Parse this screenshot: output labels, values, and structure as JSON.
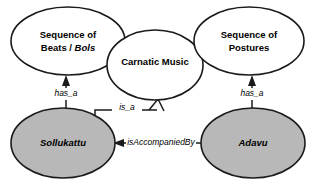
{
  "diagram": {
    "type": "entity-relationship-graph",
    "background_color": "#ffffff",
    "stroke_color": "#1a1a1a",
    "shaded_fill": "#b8b8b8",
    "plain_fill": "#ffffff",
    "nodes": [
      {
        "id": "beats",
        "label_line1": "Sequence of",
        "label_line2_plain": "Beats / ",
        "label_line2_italic": "Bols",
        "style": "white",
        "cx": 68,
        "cy": 41,
        "rx": 57,
        "ry": 34
      },
      {
        "id": "carnatic",
        "label_line1": "Carnatic Music",
        "style": "white",
        "cx": 155,
        "cy": 65,
        "rx": 48,
        "ry": 35
      },
      {
        "id": "postures",
        "label_line1": "Sequence of",
        "label_line2_plain": "Postures",
        "style": "white",
        "cx": 249,
        "cy": 41,
        "rx": 55,
        "ry": 34
      },
      {
        "id": "sollukattu",
        "label_line1": "Sollukattu",
        "style": "gray-italic",
        "cx": 63,
        "cy": 143,
        "rx": 52,
        "ry": 35
      },
      {
        "id": "adavu",
        "label_line1": "Adavu",
        "style": "gray-italic",
        "cx": 253,
        "cy": 143,
        "rx": 52,
        "ry": 35
      }
    ],
    "edges": [
      {
        "id": "sollukattu-has_a-beats",
        "label": "has_a",
        "from": "sollukattu",
        "to": "beats",
        "arrowhead": "filled-triangle",
        "label_x": 66,
        "label_y": 94
      },
      {
        "id": "adavu-has_a-postures",
        "label": "has_a",
        "from": "adavu",
        "to": "postures",
        "arrowhead": "filled-triangle",
        "label_x": 252,
        "label_y": 94
      },
      {
        "id": "sollukattu-is_a-carnatic",
        "label": "is_a",
        "from": "sollukattu",
        "to": "carnatic",
        "arrowhead": "open-triangle",
        "label_x": 127,
        "label_y": 108
      },
      {
        "id": "adavu-isAccompaniedBy-sollukattu",
        "label": "isAccompaniedBy",
        "from": "adavu",
        "to": "sollukattu",
        "arrowhead": "filled-triangle",
        "label_x": 160,
        "label_y": 143
      }
    ]
  }
}
